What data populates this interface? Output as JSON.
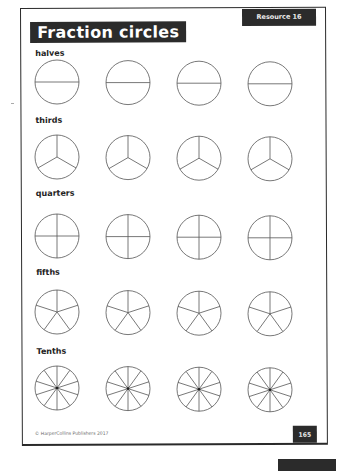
{
  "title": "Fraction circles",
  "resource_label": "Resource 16",
  "rows": [
    {
      "label": "halves",
      "divisions": 2,
      "label_y": 46,
      "cy": 82
    },
    {
      "label": "thirds",
      "divisions": 3,
      "label_y": 114,
      "cy": 157
    },
    {
      "label": "quarters",
      "divisions": 4,
      "label_y": 186,
      "cy": 236
    },
    {
      "label": "fifths",
      "divisions": 5,
      "label_y": 265,
      "cy": 312
    },
    {
      "label": "Tenths",
      "divisions": 10,
      "label_y": 344,
      "cy": 388
    }
  ],
  "circle_columns_x": [
    57,
    128,
    199,
    270
  ],
  "circle_radius": 22,
  "footer": {
    "copyright": "© HarperCollins Publishers 2017",
    "page_number": "165"
  },
  "colors": {
    "ink": "#2b2b2b",
    "line": "#555555"
  }
}
